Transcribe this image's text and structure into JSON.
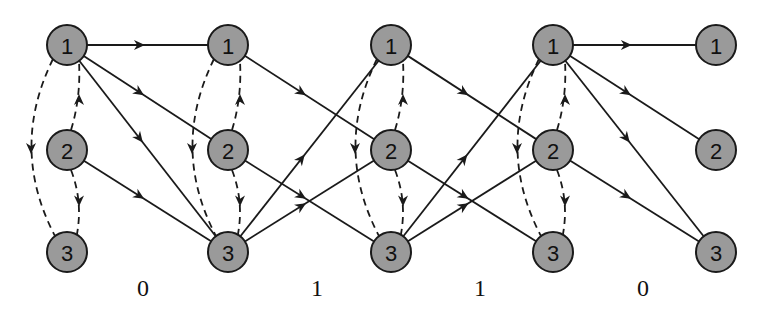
{
  "diagram": {
    "type": "trellis",
    "columns_x": [
      67,
      228,
      391,
      553,
      716
    ],
    "rows_y": [
      45,
      150,
      252
    ],
    "node_radius": 20,
    "state_labels": [
      "1",
      "2",
      "3"
    ],
    "colors": {
      "node_fill": "#9a9a9a",
      "node_stroke": "#1a1a1a",
      "edge": "#1a1a1a"
    },
    "solid_edges": [
      [
        [
          0,
          0
        ],
        [
          1,
          0
        ]
      ],
      [
        [
          0,
          0
        ],
        [
          1,
          1
        ]
      ],
      [
        [
          0,
          0
        ],
        [
          1,
          2
        ]
      ],
      [
        [
          0,
          1
        ],
        [
          1,
          2
        ]
      ],
      [
        [
          1,
          0
        ],
        [
          2,
          1
        ]
      ],
      [
        [
          1,
          1
        ],
        [
          2,
          2
        ]
      ],
      [
        [
          1,
          2
        ],
        [
          2,
          0
        ]
      ],
      [
        [
          1,
          2
        ],
        [
          2,
          1
        ]
      ],
      [
        [
          2,
          0
        ],
        [
          3,
          1
        ]
      ],
      [
        [
          2,
          1
        ],
        [
          3,
          2
        ]
      ],
      [
        [
          2,
          2
        ],
        [
          3,
          0
        ]
      ],
      [
        [
          2,
          2
        ],
        [
          3,
          1
        ]
      ],
      [
        [
          3,
          0
        ],
        [
          4,
          0
        ]
      ],
      [
        [
          3,
          0
        ],
        [
          4,
          1
        ]
      ],
      [
        [
          3,
          0
        ],
        [
          4,
          2
        ]
      ],
      [
        [
          3,
          1
        ],
        [
          4,
          2
        ]
      ]
    ],
    "dashed_columns": [
      0,
      1,
      2,
      3
    ],
    "dashed_edges_per_column": [
      {
        "from": "1",
        "to": "3",
        "side": "left"
      },
      {
        "from": "2",
        "to": "1",
        "side": "right"
      },
      {
        "from": "2",
        "to": "3",
        "side": "right"
      }
    ],
    "stage_labels": [
      {
        "text": "0",
        "x": 143
      },
      {
        "text": "1",
        "x": 317
      },
      {
        "text": "1",
        "x": 480
      },
      {
        "text": "0",
        "x": 643
      }
    ],
    "stage_label_y": 296
  }
}
